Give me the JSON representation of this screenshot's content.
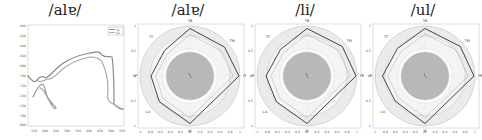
{
  "panels": [
    {
      "title": "/alɐ/"
    },
    {
      "title": "/alɐ/"
    },
    {
      "title": "/li/"
    },
    {
      "title": "/ul/"
    }
  ],
  "chart_data": [
    {
      "type": "line",
      "title": "/alɐ/",
      "xlabel": "",
      "ylabel": "",
      "xlim": [
        150,
        550
      ],
      "x_ticks": [
        "150",
        "200",
        "250",
        "300",
        "350",
        "400",
        "450",
        "500",
        "550"
      ],
      "y_ticks": [
        "-600",
        "-620",
        "-640",
        "-660",
        "-680",
        "-700",
        "-720",
        "-740",
        "-760",
        "-780",
        "-800"
      ],
      "legend": {
        "position": "upper-right",
        "entries": [
          "s1",
          "s2"
        ]
      },
      "series": [
        {
          "name": "s1",
          "description": "tongue contour trace 1 (upper)"
        },
        {
          "name": "s2",
          "description": "tongue contour trace 2 (lower)"
        }
      ],
      "grid": false
    },
    {
      "type": "radar",
      "title": "/alɐ/",
      "axes": [
        "TB",
        "TM",
        "TR",
        "JA",
        "LA",
        "LP",
        "TT"
      ],
      "values": [
        0.95,
        0.9,
        0.98,
        0.95,
        0.8,
        0.78,
        0.72
      ],
      "x_ticks": [
        "-1",
        "-0.8",
        "-0.6",
        "-0.4",
        "-0.2",
        "0",
        "0.2",
        "0.4",
        "0.6",
        "0.8",
        "1"
      ],
      "y_ticks": [
        "1",
        "0.5",
        "0",
        "-0.5",
        "-1"
      ],
      "rings": [
        0.5,
        0.75,
        1.0
      ],
      "inner_shaded_radius": 0.5
    },
    {
      "type": "radar",
      "title": "/li/",
      "axes": [
        "TB",
        "TM",
        "TR",
        "JA",
        "LA",
        "LP",
        "TT"
      ],
      "values": [
        0.95,
        0.92,
        0.98,
        0.95,
        0.8,
        0.82,
        0.75
      ],
      "x_ticks": [
        "-1",
        "-0.8",
        "-0.6",
        "-0.4",
        "-0.2",
        "0",
        "0.2",
        "0.4",
        "0.6",
        "0.8",
        "1"
      ],
      "y_ticks": [
        "1",
        "0.5",
        "0",
        "-0.5",
        "-1"
      ],
      "rings": [
        0.5,
        0.75,
        1.0
      ],
      "inner_shaded_radius": 0.5
    },
    {
      "type": "radar",
      "title": "/ul/",
      "axes": [
        "TB",
        "TM",
        "TR",
        "JA",
        "LA",
        "LP",
        "TT"
      ],
      "values": [
        0.95,
        0.92,
        0.98,
        0.95,
        0.78,
        0.85,
        0.78
      ],
      "x_ticks": [
        "-1",
        "-0.8",
        "-0.6",
        "-0.4",
        "-0.2",
        "0",
        "0.2",
        "0.4",
        "0.6",
        "0.8",
        "1"
      ],
      "y_ticks": [
        "1",
        "0.5",
        "0",
        "-0.5",
        "-1"
      ],
      "rings": [
        0.5,
        0.75,
        1.0
      ],
      "inner_shaded_radius": 0.5
    }
  ]
}
